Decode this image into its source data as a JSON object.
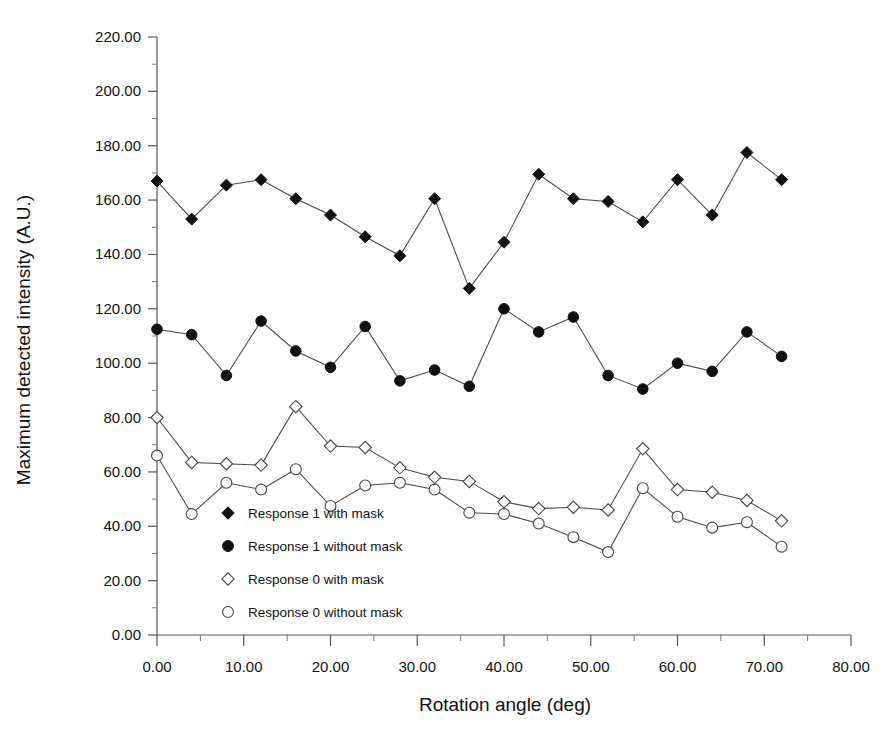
{
  "chart_data": {
    "type": "line",
    "title": "",
    "xlabel": "Rotation angle (deg)",
    "ylabel": "Maximum detected intensity (A.U.)",
    "xlim": [
      0,
      80
    ],
    "ylim": [
      0,
      220
    ],
    "xticks": [
      0,
      10,
      20,
      30,
      40,
      50,
      60,
      70,
      80
    ],
    "xtick_labels": [
      "0.00",
      "10.00",
      "20.00",
      "30.00",
      "40.00",
      "50.00",
      "60.00",
      "70.00",
      "80.00"
    ],
    "yticks": [
      0,
      20,
      40,
      60,
      80,
      100,
      120,
      140,
      160,
      180,
      200,
      220
    ],
    "ytick_labels": [
      "0.00",
      "20.00",
      "40.00",
      "60.00",
      "80.00",
      "100.00",
      "120.00",
      "140.00",
      "160.00",
      "180.00",
      "200.00",
      "220.00"
    ],
    "xminor_step": 5,
    "yminor_step": 10,
    "grid": false,
    "legend_position": "inside-lower-left",
    "line_color": "#333333",
    "marker_color": "#111111",
    "series": [
      {
        "name": "Response 1 with mask",
        "marker": "filled-diamond",
        "x": [
          0,
          4,
          8,
          12,
          16,
          20,
          24,
          28,
          32,
          36,
          40,
          44,
          48,
          52,
          56,
          60,
          64,
          68,
          72
        ],
        "values": [
          167.0,
          153.0,
          165.5,
          167.5,
          160.5,
          154.5,
          146.5,
          139.5,
          160.5,
          127.5,
          144.5,
          169.5,
          160.5,
          159.5,
          152.0,
          167.5,
          154.5,
          177.5,
          167.5
        ]
      },
      {
        "name": "Response 1 without mask",
        "marker": "filled-circle",
        "x": [
          0,
          4,
          8,
          12,
          16,
          20,
          24,
          28,
          32,
          36,
          40,
          44,
          48,
          52,
          56,
          60,
          64,
          68,
          72
        ],
        "values": [
          112.5,
          110.5,
          95.5,
          115.5,
          104.5,
          98.5,
          113.5,
          93.5,
          97.5,
          91.5,
          120.0,
          111.5,
          117.0,
          95.5,
          90.5,
          100.0,
          97.0,
          111.5,
          102.5
        ]
      },
      {
        "name": "Response 0 with mask",
        "marker": "open-diamond",
        "x": [
          0,
          4,
          8,
          12,
          16,
          20,
          24,
          28,
          32,
          36,
          40,
          44,
          48,
          52,
          56,
          60,
          64,
          68,
          72
        ],
        "values": [
          80.0,
          63.5,
          63.0,
          62.5,
          84.0,
          69.5,
          69.0,
          61.5,
          58.0,
          56.5,
          49.0,
          46.5,
          47.0,
          46.0,
          68.5,
          53.5,
          52.5,
          49.5,
          42.0
        ]
      },
      {
        "name": "Response 0 without mask",
        "marker": "open-circle",
        "x": [
          0,
          4,
          8,
          12,
          16,
          20,
          24,
          28,
          32,
          36,
          40,
          44,
          48,
          52,
          56,
          60,
          64,
          68,
          72
        ],
        "values": [
          66.0,
          44.5,
          56.0,
          53.5,
          61.0,
          47.5,
          55.0,
          56.0,
          53.5,
          45.0,
          44.5,
          41.0,
          36.0,
          30.5,
          54.0,
          43.5,
          39.5,
          41.5,
          32.5
        ]
      }
    ]
  },
  "legend": {
    "items": [
      {
        "label": "Response 1 with mask",
        "marker": "filled-diamond"
      },
      {
        "label": "Response 1 without mask",
        "marker": "filled-circle"
      },
      {
        "label": "Response 0 with mask",
        "marker": "open-diamond"
      },
      {
        "label": "Response 0 without mask",
        "marker": "open-circle"
      }
    ]
  }
}
